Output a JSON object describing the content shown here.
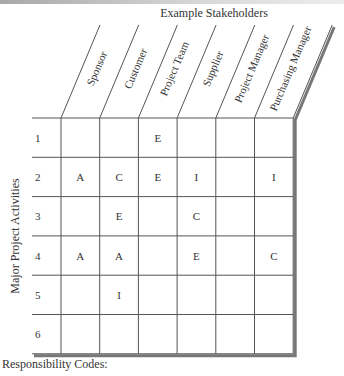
{
  "title": "Example Stakeholders",
  "row_axis_label": "Major Project Activities",
  "footer_label": "Responsibility Codes:",
  "stakeholders": [
    "Sponsor",
    "Customer",
    "Project Team",
    "Supplier",
    "Project Manager",
    "Purchasing Manager"
  ],
  "activities": [
    "1",
    "2",
    "3",
    "4",
    "5",
    "6"
  ],
  "matrix": [
    [
      "",
      "",
      "E",
      "",
      "",
      ""
    ],
    [
      "A",
      "C",
      "E",
      "I",
      "",
      "I"
    ],
    [
      "",
      "E",
      "",
      "C",
      "",
      ""
    ],
    [
      "A",
      "A",
      "",
      "E",
      "",
      "C"
    ],
    [
      "",
      "I",
      "",
      "",
      "",
      ""
    ],
    [
      "",
      "",
      "",
      "",
      "",
      ""
    ]
  ]
}
